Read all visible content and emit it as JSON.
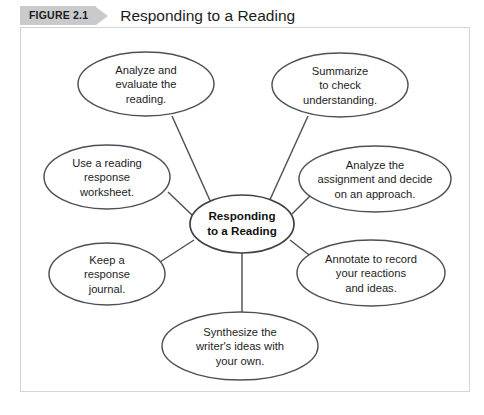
{
  "header": {
    "badge_label": "FIGURE 2.1",
    "title": "Responding to a Reading",
    "badge_color": "#c9cacc",
    "title_color": "#1c1c1c"
  },
  "frame": {
    "border_color": "#d3d4d6",
    "background": "#ffffff"
  },
  "diagram": {
    "type": "radial-cluster",
    "stroke_color": "#4d5156",
    "fill_color": "#ffffff",
    "center": {
      "label": "Responding\nto a Reading",
      "cx": 242,
      "cy": 224,
      "rx": 52,
      "ry": 29
    },
    "nodes": [
      {
        "id": "analyze-evaluate",
        "label": "Analyze and\nevaluate the\nreading.",
        "cx": 146,
        "cy": 84,
        "rx": 68,
        "ry": 32
      },
      {
        "id": "summarize-check",
        "label": "Summarize\nto check\nunderstanding.",
        "cx": 340,
        "cy": 85,
        "rx": 68,
        "ry": 32
      },
      {
        "id": "reading-response-worksheet",
        "label": "Use a reading\nresponse\nworksheet.",
        "cx": 107,
        "cy": 177,
        "rx": 63,
        "ry": 32
      },
      {
        "id": "analyze-assignment",
        "label": "Analyze the\nassignment and decide\non an approach.",
        "cx": 375,
        "cy": 179,
        "rx": 76,
        "ry": 33
      },
      {
        "id": "response-journal",
        "label": "Keep a\nresponse\njournal.",
        "cx": 107,
        "cy": 274,
        "rx": 58,
        "ry": 31
      },
      {
        "id": "annotate-reactions",
        "label": "Annotate to record\nyour reactions\nand ideas.",
        "cx": 371,
        "cy": 273,
        "rx": 74,
        "ry": 33
      },
      {
        "id": "synthesize-ideas",
        "label": "Synthesize the\nwriter's ideas with\nyour own.",
        "cx": 240,
        "cy": 346,
        "rx": 78,
        "ry": 34
      }
    ],
    "connectors": [
      {
        "from": "center",
        "to": "analyze-evaluate",
        "x1": 212,
        "y1": 205,
        "x2": 172,
        "y2": 116
      },
      {
        "from": "center",
        "to": "summarize-check",
        "x1": 268,
        "y1": 204,
        "x2": 308,
        "y2": 116
      },
      {
        "from": "center",
        "to": "reading-response-worksheet",
        "x1": 192,
        "y1": 215,
        "x2": 168,
        "y2": 192
      },
      {
        "from": "center",
        "to": "analyze-assignment",
        "x1": 292,
        "y1": 214,
        "x2": 312,
        "y2": 194
      },
      {
        "from": "center",
        "to": "response-journal",
        "x1": 194,
        "y1": 240,
        "x2": 160,
        "y2": 262
      },
      {
        "from": "center",
        "to": "annotate-reactions",
        "x1": 290,
        "y1": 240,
        "x2": 313,
        "y2": 258
      },
      {
        "from": "center",
        "to": "synthesize-ideas",
        "x1": 242,
        "y1": 253,
        "x2": 242,
        "y2": 312
      }
    ]
  }
}
